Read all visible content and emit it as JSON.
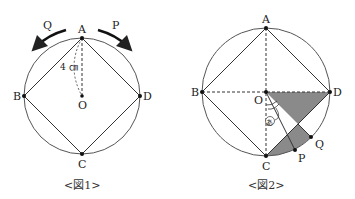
{
  "figure1": {
    "caption": "<図1>",
    "labels": {
      "A": "A",
      "B": "B",
      "C": "C",
      "D": "D",
      "O": "O",
      "P": "P",
      "Q": "Q"
    },
    "radius_label": "4 ㎝",
    "arrows": [
      {
        "name": "P",
        "direction": "clockwise"
      },
      {
        "name": "Q",
        "direction": "counterclockwise"
      }
    ]
  },
  "figure2": {
    "caption": "<図2>",
    "labels": {
      "A": "A",
      "B": "B",
      "C": "C",
      "D": "D",
      "O": "O",
      "P": "P",
      "Q": "Q"
    },
    "angle_label": "あ",
    "shaded_color": "#888888"
  },
  "colors": {
    "line": "#333333",
    "circle": "#555555",
    "shade": "#8a8a8a",
    "background": "#ffffff"
  }
}
